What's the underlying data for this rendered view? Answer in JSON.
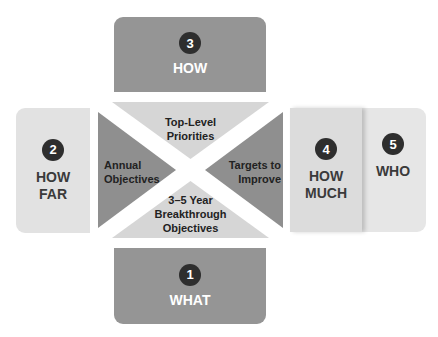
{
  "diagram": {
    "center_matrix": {
      "top": "Top-Level\nPriorities",
      "left": "Annual\nObjectives",
      "right": "Targets to\nImprove",
      "bottom": "3–5 Year\nBreakthrough\nObjectives",
      "top_lines": [
        "Top-Level",
        "Priorities"
      ],
      "left_lines": [
        "Annual",
        "Objectives"
      ],
      "right_lines": [
        "Targets to",
        "Improve"
      ],
      "bottom_lines": [
        "3–5 Year",
        "Breakthrough",
        "Objectives"
      ]
    },
    "boxes": [
      {
        "number": "1",
        "label": "WHAT",
        "position": "bottom"
      },
      {
        "number": "2",
        "label_lines": [
          "HOW",
          "FAR"
        ],
        "position": "left"
      },
      {
        "number": "3",
        "label": "HOW",
        "position": "top"
      },
      {
        "number": "4",
        "label_lines": [
          "HOW",
          "MUCH"
        ],
        "position": "right-inner"
      },
      {
        "number": "5",
        "label": "WHO",
        "position": "right-outer"
      }
    ],
    "colors": {
      "dark_panel": "#959595",
      "light_panel": "#e2e2e2",
      "dark_triangle": "#8f8f8f",
      "light_triangle": "#d6d6d6",
      "badge": "#2e2e2e"
    }
  }
}
